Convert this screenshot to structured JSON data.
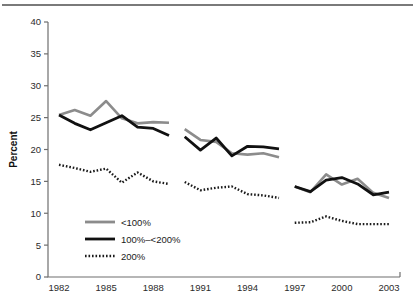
{
  "figure": {
    "has_top_rule": true,
    "background_color": "#ffffff"
  },
  "chart_data": {
    "type": "line",
    "title": "",
    "subtitle": "",
    "xlabel": "",
    "ylabel": "Percent",
    "xlim": [
      1981.3,
      2003.7
    ],
    "ylim": [
      0,
      40
    ],
    "ytick_labels": [
      "0",
      "5",
      "10",
      "15",
      "20",
      "25",
      "30",
      "35",
      "40"
    ],
    "ytick_values": [
      0,
      5,
      10,
      15,
      20,
      25,
      30,
      35,
      40
    ],
    "xtick_labels": [
      "1982",
      "1985",
      "1988",
      "1991",
      "1994",
      "1997",
      "2000",
      "2003"
    ],
    "xtick_values": [
      1982,
      1985,
      1988,
      1991,
      1994,
      1997,
      2000,
      2003
    ],
    "grid": false,
    "legend_position": "lower-left-inside",
    "segment_breaks": [
      [
        1989,
        1990
      ],
      [
        1996,
        1997
      ]
    ],
    "series": [
      {
        "name": "<100%",
        "color": "#8c8c8c",
        "style": "solid",
        "width": 2.6,
        "segments": [
          {
            "x": [
              1982,
              1983,
              1984,
              1985,
              1986,
              1987,
              1988,
              1989
            ],
            "values": [
              25.4,
              26.2,
              25.3,
              27.6,
              24.9,
              24.1,
              24.3,
              24.2
            ]
          },
          {
            "x": [
              1990,
              1991,
              1992,
              1993,
              1994,
              1995,
              1996
            ],
            "values": [
              23.2,
              21.5,
              21.2,
              19.4,
              19.2,
              19.4,
              18.8
            ]
          },
          {
            "x": [
              1997,
              1998,
              1999,
              2000,
              2001,
              2002,
              2003
            ],
            "values": [
              14.2,
              13.3,
              16.1,
              14.5,
              15.4,
              13.2,
              12.4
            ]
          }
        ]
      },
      {
        "name": "100%–<200%",
        "color": "#111111",
        "style": "solid",
        "width": 2.8,
        "segments": [
          {
            "x": [
              1982,
              1983,
              1984,
              1985,
              1986,
              1987,
              1988,
              1989
            ],
            "values": [
              25.4,
              24.1,
              23.1,
              24.2,
              25.3,
              23.5,
              23.3,
              22.2
            ]
          },
          {
            "x": [
              1990,
              1991,
              1992,
              1993,
              1994,
              1995,
              1996
            ],
            "values": [
              22.0,
              19.9,
              21.8,
              19.0,
              20.5,
              20.4,
              20.1
            ]
          },
          {
            "x": [
              1997,
              1998,
              1999,
              2000,
              2001,
              2002,
              2003
            ],
            "values": [
              14.2,
              13.4,
              15.2,
              15.6,
              14.6,
              12.9,
              13.3
            ]
          }
        ]
      },
      {
        "name": "200%",
        "color": "#1a1a1a",
        "style": "dotted",
        "width": 2.6,
        "segments": [
          {
            "x": [
              1982,
              1983,
              1984,
              1985,
              1986,
              1987,
              1988,
              1989
            ],
            "values": [
              17.6,
              17.1,
              16.5,
              17.0,
              14.8,
              16.4,
              15.0,
              14.6
            ]
          },
          {
            "x": [
              1990,
              1991,
              1992,
              1993,
              1994,
              1995,
              1996
            ],
            "values": [
              14.9,
              13.6,
              14.0,
              14.2,
              13.0,
              12.8,
              12.4
            ]
          },
          {
            "x": [
              1997,
              1998,
              1999,
              2000,
              2001,
              2002,
              2003
            ],
            "values": [
              8.5,
              8.6,
              9.5,
              8.8,
              8.3,
              8.3,
              8.3
            ]
          }
        ]
      }
    ],
    "legend": [
      {
        "label": "<100%",
        "color": "#8c8c8c",
        "style": "solid"
      },
      {
        "label": "100%–<200%",
        "color": "#111111",
        "style": "solid"
      },
      {
        "label": "200%",
        "color": "#1a1a1a",
        "style": "dotted"
      }
    ]
  }
}
